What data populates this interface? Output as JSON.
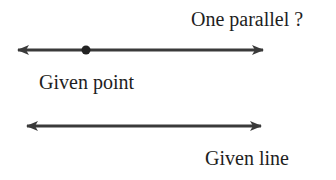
{
  "diagram": {
    "labels": {
      "parallel_question": "One parallel ?",
      "given_point": "Given point",
      "given_line": "Given line"
    },
    "colors": {
      "line": "#3a3a3a",
      "point": "#222222",
      "text": "#1e1e1e",
      "background": "#ffffff"
    },
    "elements": {
      "candidate_parallel_line": {
        "x1": 16,
        "x2": 265,
        "y": 50,
        "arrows": "both"
      },
      "given_point": {
        "x": 86,
        "y": 50
      },
      "given_line": {
        "x1": 25,
        "x2": 263,
        "y": 126,
        "arrows": "both"
      }
    }
  }
}
